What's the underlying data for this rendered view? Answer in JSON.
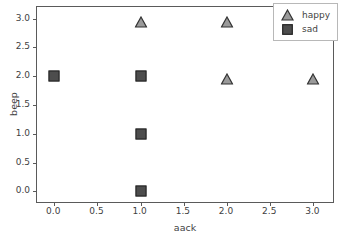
{
  "chart_data": {
    "type": "scatter",
    "title": "",
    "xlabel": "aack",
    "ylabel": "beep",
    "xlim": [
      -0.2,
      3.25
    ],
    "ylim": [
      -0.22,
      3.2
    ],
    "grid": false,
    "legend_position": "upper right",
    "xticks": [
      "0.0",
      "0.5",
      "1.0",
      "1.5",
      "2.0",
      "2.5",
      "3.0"
    ],
    "xtick_values": [
      0.0,
      0.5,
      1.0,
      1.5,
      2.0,
      2.5,
      3.0
    ],
    "yticks": [
      "0.0",
      "0.5",
      "1.0",
      "1.5",
      "2.0",
      "2.5",
      "3.0"
    ],
    "ytick_values": [
      0.0,
      0.5,
      1.0,
      1.5,
      2.0,
      2.5,
      3.0
    ],
    "series": [
      {
        "name": "happy",
        "marker": "triangle",
        "color": "#9a9a9a",
        "edge_color": "#333333",
        "points": [
          {
            "x": 1,
            "y": 3
          },
          {
            "x": 2,
            "y": 3
          },
          {
            "x": 2,
            "y": 2
          },
          {
            "x": 3,
            "y": 2
          }
        ]
      },
      {
        "name": "sad",
        "marker": "square",
        "color": "#4d4d4d",
        "edge_color": "#222222",
        "points": [
          {
            "x": 0,
            "y": 2
          },
          {
            "x": 1,
            "y": 2
          },
          {
            "x": 1,
            "y": 1
          },
          {
            "x": 1,
            "y": 0
          }
        ]
      }
    ]
  },
  "legend": {
    "entries": [
      {
        "label": "happy",
        "marker": "triangle-icon"
      },
      {
        "label": "sad",
        "marker": "square-icon"
      }
    ]
  }
}
